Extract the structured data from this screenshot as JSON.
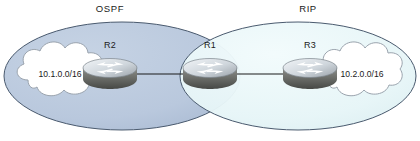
{
  "diagram": {
    "canvas": {
      "width": 420,
      "height": 141,
      "background": "#ffffff"
    },
    "domains": [
      {
        "id": "ospf-domain",
        "label": "OSPF",
        "fill": "#b9c8dd",
        "stroke": "#4a5a6e",
        "label_x": 110,
        "label_y": 12
      },
      {
        "id": "rip-domain",
        "label": "RIP",
        "fill": "#e6f5f7",
        "stroke": "#4a5a6e",
        "label_x": 308,
        "label_y": 12
      }
    ],
    "routers": [
      {
        "id": "r2",
        "label": "R2",
        "x": 110,
        "y": 72,
        "label_x": 110,
        "label_y": 48
      },
      {
        "id": "r1",
        "label": "R1",
        "x": 210,
        "y": 72,
        "label_x": 210,
        "label_y": 48
      },
      {
        "id": "r3",
        "label": "R3",
        "x": 310,
        "y": 72,
        "label_x": 310,
        "label_y": 48
      }
    ],
    "clouds": [
      {
        "id": "cloud-left",
        "label": "10.1.0.0/16",
        "cx": 62,
        "cy": 74,
        "fill": "#ffffff",
        "stroke": "#9aa3ad"
      },
      {
        "id": "cloud-right",
        "label": "10.2.0.0/16",
        "cx": 362,
        "cy": 74,
        "fill": "#ffffff",
        "stroke": "#9aa3ad"
      }
    ],
    "links": [
      {
        "id": "link-r2-r1",
        "from": "R2",
        "to": "R1",
        "x1": 137,
        "y1": 74,
        "x2": 186,
        "y2": 74
      },
      {
        "id": "link-r1-r3",
        "from": "R1",
        "to": "R3",
        "x1": 236,
        "y1": 74,
        "x2": 285,
        "y2": 74
      }
    ],
    "colors": {
      "router_top": "#e9edf1",
      "router_body": "#6d6f6b",
      "router_body_dark": "#4f514e",
      "link_stroke": "#1a1a1a",
      "text": "#1a1a1a"
    }
  }
}
